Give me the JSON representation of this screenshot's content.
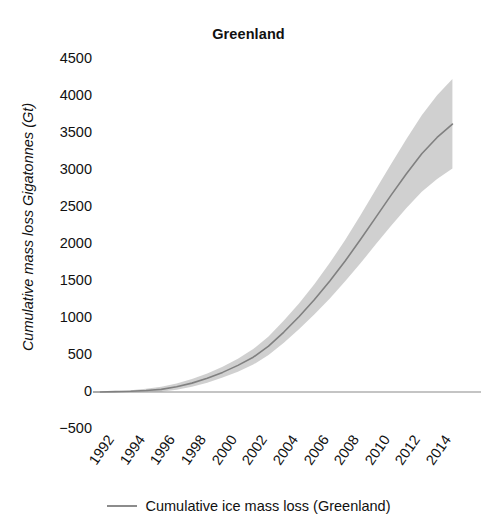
{
  "chart_data": {
    "type": "line",
    "title": "Greenland",
    "xlabel": "",
    "ylabel": "Cumulative mass loss Gigatonnes (Gt)",
    "xlim": [
      1992,
      2015.3
    ],
    "ylim": [
      -500,
      4500
    ],
    "grid": false,
    "legend_position": "bottom-center",
    "legend": [
      "Cumulative ice mass loss (Greenland)"
    ],
    "y_ticks": [
      4500,
      4000,
      3500,
      3000,
      2500,
      2000,
      1500,
      1000,
      500,
      0,
      -500
    ],
    "y_tick_labels": [
      "4500",
      "4000",
      "3500",
      "3000",
      "2500",
      "2000",
      "1500",
      "1000",
      "500",
      "0",
      "−500"
    ],
    "x_ticks": [
      1992,
      1994,
      1996,
      1998,
      2000,
      2002,
      2004,
      2006,
      2008,
      2010,
      2012,
      2014
    ],
    "x_tick_labels": [
      "1992",
      "1994",
      "1996",
      "1998",
      "2000",
      "2002",
      "2004",
      "2006",
      "2008",
      "2010",
      "2012",
      "2014"
    ],
    "zero_line": 0,
    "series": [
      {
        "name": "Cumulative ice mass loss (Greenland)",
        "color": "#808080",
        "band_color": "#c8c8c8",
        "x": [
          1992,
          1993,
          1994,
          1995,
          1996,
          1997,
          1998,
          1999,
          2000,
          2001,
          2002,
          2003,
          2004,
          2005,
          2006,
          2007,
          2008,
          2009,
          2010,
          2011,
          2012,
          2013,
          2014,
          2015
        ],
        "values": [
          0,
          5,
          10,
          20,
          35,
          70,
          120,
          185,
          265,
          360,
          470,
          620,
          810,
          1020,
          1250,
          1500,
          1770,
          2060,
          2360,
          2660,
          2950,
          3220,
          3440,
          3620
        ],
        "lower": [
          0,
          0,
          -5,
          0,
          5,
          30,
          70,
          125,
          195,
          275,
          370,
          500,
          665,
          850,
          1050,
          1265,
          1495,
          1740,
          1995,
          2245,
          2485,
          2705,
          2880,
          3020
        ],
        "upper": [
          0,
          10,
          25,
          45,
          70,
          115,
          175,
          250,
          340,
          450,
          580,
          750,
          965,
          1200,
          1460,
          1745,
          2055,
          2390,
          2735,
          3080,
          3420,
          3740,
          4010,
          4230
        ]
      }
    ]
  },
  "axes": {
    "title_text": "Greenland",
    "ylabel_text": "Cumulative mass loss Gigatonnes (Gt)"
  },
  "legend": {
    "label": "Cumulative ice mass loss (Greenland)",
    "swatch_color": "#8c8c8c"
  }
}
